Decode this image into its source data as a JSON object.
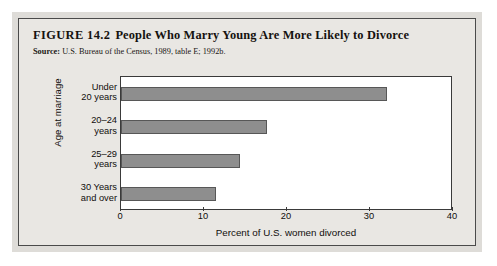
{
  "figure": {
    "number": "FIGURE 14.2",
    "title": "People Who Marry Young Are More Likely to Divorce",
    "source_label": "Source:",
    "source_text": "U.S. Bureau of the Census, 1989, table E; 1992b."
  },
  "colors": {
    "bar_fill": "#8e8e8e",
    "bar_stroke": "#575757",
    "panel_bg": "#e9e7e3",
    "plot_bg": "#ffffff",
    "axis": "#3a3a3a"
  },
  "chart_data": {
    "type": "bar",
    "orientation": "horizontal",
    "title": "People Who Marry Young Are More Likely to Divorce",
    "subtitle": "",
    "categories": [
      "Under 20 years",
      "20–24 years",
      "25–29 years",
      "30 Years and over"
    ],
    "category_lines": [
      [
        "Under",
        "20 years"
      ],
      [
        "20–24",
        "years"
      ],
      [
        "25–29",
        "years"
      ],
      [
        "30 Years",
        "and over"
      ]
    ],
    "values": [
      32,
      17.6,
      14.3,
      11.5
    ],
    "xlabel": "Percent of U.S. women divorced",
    "ylabel": "Age at marriage",
    "xlim": [
      0,
      40
    ],
    "xticks": [
      0,
      10,
      20,
      30,
      40
    ],
    "xtick_labels": [
      "0",
      "10",
      "20",
      "30",
      "40"
    ],
    "grid": false,
    "legend": false
  }
}
